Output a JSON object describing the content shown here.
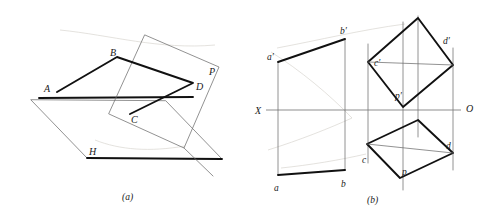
{
  "figure": {
    "title_visible": false,
    "captions": [
      {
        "id": "caption-a",
        "text": "(a)",
        "x": 122,
        "y": 200
      },
      {
        "id": "caption-b",
        "text": "(b)",
        "x": 367,
        "y": 203
      }
    ],
    "colors": {
      "stroke_thick": "#111111",
      "stroke_thin": "#6e6e6e",
      "axis": "#7a7a7a",
      "background": "#ffffff",
      "label": "#1a1a1a"
    },
    "panel_a": {
      "name": "pictorial-view",
      "labels": [
        {
          "id": "label-A",
          "text": "A",
          "x": 44,
          "y": 92
        },
        {
          "id": "label-B",
          "text": "B",
          "x": 110,
          "y": 56
        },
        {
          "id": "label-C",
          "text": "C",
          "x": 131,
          "y": 123
        },
        {
          "id": "label-D",
          "text": "D",
          "x": 196,
          "y": 90
        },
        {
          "id": "label-P",
          "text": "P",
          "x": 209,
          "y": 75
        },
        {
          "id": "label-H",
          "text": "H",
          "x": 89,
          "y": 155
        }
      ],
      "h_plane": "31,100 87,158 222,159 166,101",
      "p_plane": "145,35 219,67 184,148 109,114",
      "quad_ABCD": "57,92 117,57 193,83 130,114",
      "trace_line": "39,98 193,97",
      "p_base_extra": "184,148 213,176"
    },
    "panel_b": {
      "name": "orthographic-projection",
      "axis": {
        "label_x": "X",
        "label_o": "O",
        "x_label_pos": {
          "x": 255,
          "y": 117
        },
        "o_label_pos": {
          "x": 466,
          "y": 114
        },
        "line": {
          "x1": 266,
          "y1": 110,
          "x2": 461,
          "y2": 110
        }
      },
      "left_view": {
        "name": "front-view-quadrilateral",
        "outline_top": "278,62 345,39",
        "outline_bottom": "278,175 345,170",
        "vertical_left": "278,62 278,175",
        "vertical_right": "345,39 345,170",
        "labels": [
          {
            "id": "label-a-prime",
            "text": "a′",
            "x": 268,
            "y": 60
          },
          {
            "id": "label-b-prime",
            "text": "b′",
            "x": 341,
            "y": 34
          },
          {
            "id": "label-a",
            "text": "a",
            "x": 274,
            "y": 190
          },
          {
            "id": "label-b",
            "text": "b",
            "x": 341,
            "y": 186
          }
        ]
      },
      "upper_parallelogram": {
        "name": "v-projection-parallelogram",
        "points": "418,18 453,65 403,107 368,62",
        "diagonal": "368,62 453,65",
        "labels": [
          {
            "id": "label-c-prime",
            "text": "c′",
            "x": 375,
            "y": 66
          },
          {
            "id": "label-d-prime",
            "text": "d′",
            "x": 444,
            "y": 43
          },
          {
            "id": "label-p-prime",
            "text": "p′",
            "x": 396,
            "y": 98
          }
        ]
      },
      "lower_parallelogram": {
        "name": "h-projection-parallelogram",
        "points": "418,120 453,153 400,178 367,144",
        "diagonal": "367,144 453,153",
        "labels": [
          {
            "id": "label-c",
            "text": "c",
            "x": 364,
            "y": 162
          },
          {
            "id": "label-d",
            "text": "d",
            "x": 447,
            "y": 148
          },
          {
            "id": "label-p",
            "text": "p",
            "x": 403,
            "y": 174
          }
        ]
      },
      "projection_lines": [
        {
          "id": "projector-c",
          "x": 368,
          "y1": 44,
          "y2": 163
        },
        {
          "id": "projector-p",
          "x": 403,
          "y1": 22,
          "y2": 190
        },
        {
          "id": "projector-top",
          "x": 418,
          "y1": 16,
          "y2": 137
        },
        {
          "id": "projector-d",
          "x": 453,
          "y1": 48,
          "y2": 170
        }
      ]
    }
  }
}
